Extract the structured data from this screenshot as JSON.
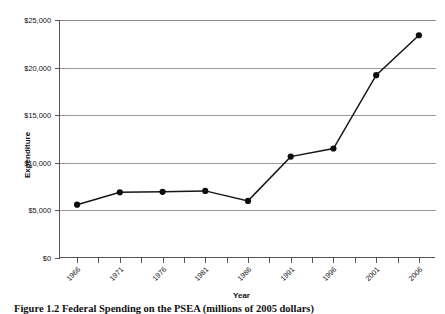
{
  "chart_data": {
    "type": "line",
    "title": "",
    "xlabel": "Year",
    "ylabel": "Expenditure",
    "x": [
      1966,
      1971,
      1976,
      1981,
      1986,
      1991,
      1996,
      2001,
      2006
    ],
    "categories": [
      "1966",
      "1971",
      "1976",
      "1981",
      "1986",
      "1991",
      "1996",
      "2001",
      "2006"
    ],
    "values": [
      5600,
      6900,
      6950,
      7050,
      6000,
      10650,
      11500,
      19200,
      23400
    ],
    "series": [
      {
        "name": "Expenditure",
        "values": [
          5600,
          6900,
          6950,
          7050,
          6000,
          10650,
          11500,
          19200,
          23400
        ]
      }
    ],
    "ylim": [
      0,
      25000
    ],
    "xlim": [
      1964,
      2008
    ],
    "ytick_values": [
      0,
      5000,
      10000,
      15000,
      20000,
      25000
    ],
    "ytick_labels": [
      "$0",
      "$5,000",
      "$10,000",
      "$15,000",
      "$20,000",
      "$25,000"
    ],
    "xtick_labels": [
      "1966",
      "1971",
      "1976",
      "1981",
      "1986",
      "1991",
      "1996",
      "2001",
      "2006"
    ],
    "grid": "horizontal",
    "legend": "none",
    "marker": "circle",
    "line_color": "#161616",
    "marker_color": "#0d0d0d",
    "grid_color": "#9a9a9a",
    "axis_color": "#555555",
    "background": "#ffffff"
  },
  "figure": {
    "caption": "Figure 1.2   Federal Spending on the PSEA (millions of 2005 dollars)"
  }
}
